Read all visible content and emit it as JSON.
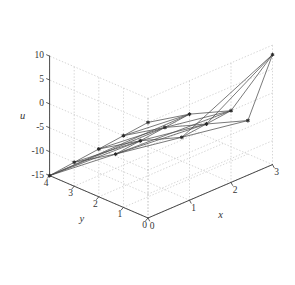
{
  "figure": {
    "background_color": "#ffffff",
    "axis_color": "#4a4a4a",
    "grid_color": "#c9c9c9",
    "mesh_color": "#4d4d4d",
    "marker_color": "#2a2a2a",
    "tick_text_color": "#353535"
  },
  "chart_data": {
    "type": "line",
    "plot_kind": "3d-triangular-mesh",
    "title": "",
    "xlabel": "x",
    "ylabel": "y",
    "zlabel": "u",
    "xlim": [
      0,
      3
    ],
    "ylim": [
      0,
      4
    ],
    "zlim": [
      -15,
      10
    ],
    "xticks": [
      0,
      1,
      2,
      3
    ],
    "yticks": [
      0,
      1,
      2,
      3,
      4
    ],
    "zticks": [
      -15,
      -10,
      -5,
      0,
      5,
      10
    ],
    "xtick_labels": [
      "0",
      "1",
      "2",
      "3"
    ],
    "ytick_labels": [
      "0",
      "1",
      "2",
      "3",
      "4"
    ],
    "ztick_labels": [
      "-15",
      "-10",
      "-5",
      "0",
      "5",
      "10"
    ],
    "grid": true,
    "legend": null,
    "view_azimuth": -37.5,
    "view_elevation": 30,
    "vertices": [
      {
        "id": 0,
        "x": 0.0,
        "y": 4.0,
        "u": -15.0
      },
      {
        "id": 1,
        "x": 0.0,
        "y": 3.0,
        "u": -10.0
      },
      {
        "id": 2,
        "x": 0.0,
        "y": 2.0,
        "u": -5.0
      },
      {
        "id": 3,
        "x": 0.0,
        "y": 1.0,
        "u": 0.0
      },
      {
        "id": 4,
        "x": 0.0,
        "y": 0.0,
        "u": 5.0
      },
      {
        "id": 5,
        "x": 1.0,
        "y": 3.0,
        "u": -12.0
      },
      {
        "id": 6,
        "x": 1.0,
        "y": 2.0,
        "u": -7.0
      },
      {
        "id": 7,
        "x": 1.0,
        "y": 1.0,
        "u": -2.0
      },
      {
        "id": 8,
        "x": 1.0,
        "y": 0.0,
        "u": 3.0
      },
      {
        "id": 9,
        "x": 2.0,
        "y": 2.0,
        "u": -10.0
      },
      {
        "id": 10,
        "x": 2.0,
        "y": 1.0,
        "u": -5.0
      },
      {
        "id": 11,
        "x": 2.0,
        "y": 0.0,
        "u": 0.0
      },
      {
        "id": 12,
        "x": 3.0,
        "y": 1.0,
        "u": -8.0
      },
      {
        "id": 13,
        "x": 3.0,
        "y": 0.0,
        "u": 8.0
      }
    ],
    "edges": [
      [
        0,
        1
      ],
      [
        1,
        2
      ],
      [
        2,
        3
      ],
      [
        3,
        4
      ],
      [
        0,
        5
      ],
      [
        1,
        5
      ],
      [
        1,
        6
      ],
      [
        2,
        6
      ],
      [
        2,
        7
      ],
      [
        3,
        7
      ],
      [
        3,
        8
      ],
      [
        4,
        8
      ],
      [
        5,
        6
      ],
      [
        6,
        7
      ],
      [
        7,
        8
      ],
      [
        5,
        9
      ],
      [
        6,
        9
      ],
      [
        6,
        10
      ],
      [
        7,
        10
      ],
      [
        7,
        11
      ],
      [
        8,
        11
      ],
      [
        9,
        10
      ],
      [
        10,
        11
      ],
      [
        9,
        12
      ],
      [
        10,
        12
      ],
      [
        10,
        13
      ],
      [
        11,
        13
      ],
      [
        12,
        13
      ],
      [
        0,
        6
      ],
      [
        0,
        7
      ],
      [
        0,
        8
      ],
      [
        5,
        10
      ],
      [
        5,
        11
      ],
      [
        9,
        13
      ]
    ],
    "n_vertices": 14,
    "n_edges": 34
  },
  "axis_labels": {
    "x_title": "x",
    "y_title": "y",
    "u_title": "u"
  }
}
